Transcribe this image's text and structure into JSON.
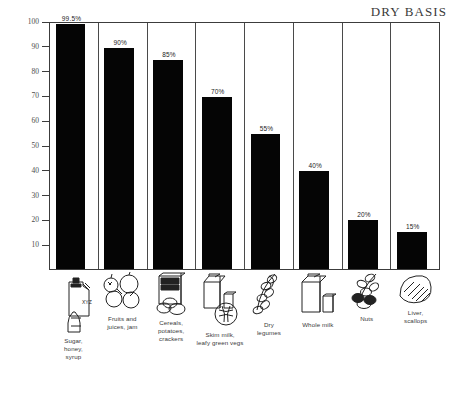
{
  "chart_data": {
    "type": "bar",
    "title": "DRY BASIS",
    "xlabel": "",
    "ylabel": "PERCENT",
    "ylim": [
      0,
      100
    ],
    "yticks": [
      10,
      20,
      30,
      40,
      50,
      60,
      70,
      80,
      90,
      100
    ],
    "ytick_labels": [
      "10",
      "20",
      "30",
      "40",
      "50",
      "60",
      "70",
      "80",
      "90",
      "100"
    ],
    "grid": false,
    "legend": "none",
    "categories": [
      "Sugar, honey, syrup",
      "Fruits and juices, jam",
      "Cereals, potatoes, crackers",
      "Skim milk, leafy green vegs",
      "Dry legumes",
      "Whole milk",
      "Nuts",
      "Liver, scallops"
    ],
    "values": [
      99.5,
      90,
      85,
      70,
      55,
      40,
      20,
      15
    ],
    "data_labels": [
      "99.5%",
      "90%",
      "85%",
      "70%",
      "55%",
      "40%",
      "20%",
      "15%"
    ],
    "bar_color": "#050505",
    "frame_color": "#3c3c3c"
  },
  "columns": [
    {
      "value": 99.5,
      "label": "99.5%",
      "caption": "Sugar,\nhoney,\nsyrup",
      "icon": "syrup-bottle-and-sugar-bag-icon"
    },
    {
      "value": 90,
      "label": "90%",
      "caption": "Fruits and\njuices, jam",
      "icon": "fruits-icon"
    },
    {
      "value": 85,
      "label": "85%",
      "caption": "Cereals,\npotatoes,\ncrackers",
      "icon": "cereal-box-and-potatoes-icon"
    },
    {
      "value": 70,
      "label": "70%",
      "caption": "Skim milk,\nleafy green vegs",
      "icon": "milk-carton-and-greens-icon"
    },
    {
      "value": 55,
      "label": "55%",
      "caption": "Dry\nlegumes",
      "icon": "legumes-icon"
    },
    {
      "value": 40,
      "label": "40%",
      "caption": "Whole milk",
      "icon": "milk-carton-and-glass-icon"
    },
    {
      "value": 20,
      "label": "20%",
      "caption": "Nuts",
      "icon": "nuts-icon"
    },
    {
      "value": 15,
      "label": "15%",
      "caption": "Liver,\nscallops",
      "icon": "liver-scallop-icon"
    }
  ]
}
